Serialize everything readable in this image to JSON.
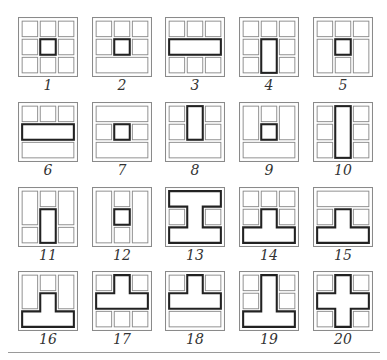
{
  "colors": {
    "thin": "#8a8a8a",
    "thick": "#222222",
    "outer": "#8a8a8a"
  },
  "layout": {
    "cols_x": [
      18,
      92,
      165,
      239,
      313
    ],
    "rows_y": [
      17,
      102,
      187,
      271
    ]
  },
  "figures": [
    {
      "label": "1",
      "thin": [
        [
          4,
          4,
          15,
          15
        ],
        [
          21.5,
          4,
          15,
          15
        ],
        [
          39,
          4,
          15,
          15
        ],
        [
          4,
          21.5,
          15,
          15
        ],
        [
          39,
          21.5,
          15,
          15
        ],
        [
          4,
          39,
          15,
          15
        ],
        [
          21.5,
          39,
          15,
          15
        ],
        [
          39,
          39,
          15,
          15
        ]
      ],
      "thick": [
        [
          21.5,
          21.5,
          15,
          15
        ]
      ],
      "poly": []
    },
    {
      "label": "2",
      "thin": [
        [
          4,
          4,
          15,
          15
        ],
        [
          21.5,
          4,
          15,
          15
        ],
        [
          39,
          4,
          15,
          15
        ],
        [
          4,
          21.5,
          15,
          15
        ],
        [
          39,
          21.5,
          15,
          15
        ],
        [
          4,
          39,
          50,
          15
        ]
      ],
      "thick": [
        [
          21.5,
          21.5,
          15,
          15
        ]
      ],
      "poly": []
    },
    {
      "label": "3",
      "thin": [
        [
          4,
          4,
          15,
          15
        ],
        [
          21.5,
          4,
          15,
          15
        ],
        [
          39,
          4,
          15,
          15
        ],
        [
          4,
          39,
          15,
          15
        ],
        [
          21.5,
          39,
          15,
          15
        ],
        [
          39,
          39,
          15,
          15
        ]
      ],
      "thick": [
        [
          4,
          21.5,
          50,
          15
        ]
      ],
      "poly": []
    },
    {
      "label": "4",
      "thin": [
        [
          4,
          4,
          15,
          15
        ],
        [
          21.5,
          4,
          15,
          15
        ],
        [
          39,
          4,
          15,
          15
        ],
        [
          4,
          21.5,
          15,
          15
        ],
        [
          39,
          21.5,
          15,
          15
        ],
        [
          4,
          39,
          15,
          15
        ],
        [
          39,
          39,
          15,
          15
        ]
      ],
      "thick": [
        [
          21.5,
          21.5,
          15,
          32.5
        ]
      ],
      "poly": []
    },
    {
      "label": "5",
      "thin": [
        [
          4,
          4,
          15,
          15
        ],
        [
          21.5,
          4,
          15,
          15
        ],
        [
          39,
          4,
          15,
          15
        ],
        [
          4,
          21.5,
          15,
          32.5
        ],
        [
          39,
          21.5,
          15,
          32.5
        ],
        [
          21.5,
          39,
          15,
          15
        ]
      ],
      "thick": [
        [
          21.5,
          21.5,
          15,
          15
        ]
      ],
      "poly": []
    },
    {
      "label": "6",
      "thin": [
        [
          4,
          4,
          15,
          15
        ],
        [
          21.5,
          4,
          15,
          15
        ],
        [
          39,
          4,
          15,
          15
        ],
        [
          4,
          39,
          50,
          15
        ]
      ],
      "thick": [
        [
          4,
          21.5,
          50,
          15
        ]
      ],
      "poly": []
    },
    {
      "label": "7",
      "thin": [
        [
          4,
          4,
          50,
          15
        ],
        [
          4,
          21.5,
          15,
          15
        ],
        [
          39,
          21.5,
          15,
          15
        ],
        [
          4,
          39,
          50,
          15
        ]
      ],
      "thick": [
        [
          21.5,
          21.5,
          15,
          15
        ]
      ],
      "poly": []
    },
    {
      "label": "8",
      "thin": [
        [
          4,
          4,
          15,
          15
        ],
        [
          39,
          4,
          15,
          15
        ],
        [
          4,
          21.5,
          15,
          15
        ],
        [
          39,
          21.5,
          15,
          15
        ],
        [
          4,
          39,
          50,
          15
        ]
      ],
      "thick": [
        [
          21.5,
          4,
          15,
          32.5
        ]
      ],
      "poly": []
    },
    {
      "label": "9",
      "thin": [
        [
          4,
          4,
          15,
          32.5
        ],
        [
          21.5,
          4,
          15,
          15
        ],
        [
          39,
          4,
          15,
          32.5
        ],
        [
          4,
          39,
          50,
          15
        ]
      ],
      "thick": [
        [
          21.5,
          21.5,
          15,
          15
        ]
      ],
      "poly": []
    },
    {
      "label": "10",
      "thin": [
        [
          4,
          4,
          15,
          15
        ],
        [
          39,
          4,
          15,
          15
        ],
        [
          4,
          21.5,
          15,
          15
        ],
        [
          39,
          21.5,
          15,
          15
        ],
        [
          4,
          39,
          15,
          15
        ],
        [
          39,
          39,
          15,
          15
        ]
      ],
      "thick": [
        [
          21.5,
          4,
          15,
          50
        ]
      ],
      "poly": []
    },
    {
      "label": "11",
      "thin": [
        [
          4,
          4,
          15,
          32.5
        ],
        [
          21.5,
          4,
          15,
          15
        ],
        [
          39,
          4,
          15,
          32.5
        ],
        [
          4,
          39,
          15,
          15
        ],
        [
          39,
          39,
          15,
          15
        ]
      ],
      "thick": [
        [
          21.5,
          21.5,
          15,
          32.5
        ]
      ],
      "poly": []
    },
    {
      "label": "12",
      "thin": [
        [
          4,
          4,
          15,
          50
        ],
        [
          21.5,
          4,
          15,
          15
        ],
        [
          39,
          4,
          15,
          50
        ],
        [
          21.5,
          39,
          15,
          15
        ]
      ],
      "thick": [
        [
          21.5,
          21.5,
          15,
          15
        ]
      ],
      "poly": []
    },
    {
      "label": "13",
      "thin": [
        [
          4,
          21.5,
          15,
          15
        ],
        [
          39,
          21.5,
          15,
          15
        ]
      ],
      "thick": [],
      "poly": [
        "4,4 54,4 54,19 36.5,19 36.5,39 54,39 54,54 4,54 4,39 21.5,39 21.5,19 4,19"
      ]
    },
    {
      "label": "14",
      "thin": [
        [
          4,
          4,
          15,
          15
        ],
        [
          21.5,
          4,
          15,
          15
        ],
        [
          39,
          4,
          15,
          15
        ],
        [
          4,
          21.5,
          15,
          15
        ],
        [
          39,
          21.5,
          15,
          15
        ]
      ],
      "thick": [],
      "poly": [
        "21.5,21.5 36.5,21.5 36.5,39 54,39 54,54 4,54 4,39 21.5,39"
      ]
    },
    {
      "label": "15",
      "thin": [
        [
          4,
          4,
          50,
          15
        ],
        [
          4,
          21.5,
          15,
          15
        ],
        [
          39,
          21.5,
          15,
          15
        ]
      ],
      "thick": [],
      "poly": [
        "21.5,21.5 36.5,21.5 36.5,39 54,39 54,54 4,54 4,39 21.5,39"
      ]
    },
    {
      "label": "16",
      "thin": [
        [
          4,
          4,
          15,
          32.5
        ],
        [
          21.5,
          4,
          15,
          15
        ],
        [
          39,
          4,
          15,
          32.5
        ]
      ],
      "thick": [],
      "poly": [
        "21.5,21.5 36.5,21.5 36.5,39 54,39 54,54 4,54 4,39 21.5,39"
      ]
    },
    {
      "label": "17",
      "thin": [
        [
          4,
          4,
          15,
          15
        ],
        [
          39,
          4,
          15,
          15
        ],
        [
          4,
          39,
          15,
          15
        ],
        [
          21.5,
          39,
          15,
          15
        ],
        [
          39,
          39,
          15,
          15
        ]
      ],
      "thick": [],
      "poly": [
        "21.5,4 36.5,4 36.5,21.5 54,21.5 54,36.5 4,36.5 4,21.5 21.5,21.5"
      ]
    },
    {
      "label": "18",
      "thin": [
        [
          4,
          4,
          15,
          15
        ],
        [
          39,
          4,
          15,
          15
        ],
        [
          4,
          39,
          50,
          15
        ]
      ],
      "thick": [],
      "poly": [
        "21.5,4 36.5,4 36.5,21.5 54,21.5 54,36.5 4,36.5 4,21.5 21.5,21.5"
      ]
    },
    {
      "label": "19",
      "thin": [
        [
          4,
          4,
          15,
          15
        ],
        [
          39,
          4,
          15,
          15
        ],
        [
          4,
          21.5,
          15,
          15
        ],
        [
          39,
          21.5,
          15,
          15
        ]
      ],
      "thick": [],
      "poly": [
        "21.5,4 36.5,4 36.5,39 54,39 54,54 4,54 4,39 21.5,39"
      ]
    },
    {
      "label": "20",
      "thin": [
        [
          4,
          4,
          15,
          15
        ],
        [
          39,
          4,
          15,
          15
        ],
        [
          4,
          39,
          15,
          15
        ],
        [
          39,
          39,
          15,
          15
        ]
      ],
      "thick": [],
      "poly": [
        "21.5,4 36.5,4 36.5,21.5 54,21.5 54,36.5 36.5,36.5 36.5,54 21.5,54 21.5,36.5 4,36.5 4,21.5 21.5,21.5"
      ]
    }
  ]
}
